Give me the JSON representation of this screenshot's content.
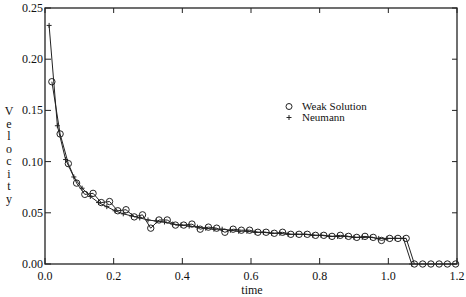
{
  "chart_data": {
    "type": "line",
    "title": "",
    "xlabel": "time",
    "ylabel": "Velocity",
    "xlim": [
      0.0,
      1.2
    ],
    "ylim": [
      0.0,
      0.25
    ],
    "xticks": [
      "0.0",
      "0.2",
      "0.4",
      "0.6",
      "0.8",
      "1.0",
      "1.2"
    ],
    "yticks": [
      "0.00",
      "0.05",
      "0.10",
      "0.15",
      "0.20",
      "0.25"
    ],
    "grid": false,
    "legend_position": "right-middle",
    "series": [
      {
        "name": "Weak Solution",
        "marker": "circle",
        "x": [
          0.02,
          0.044,
          0.068,
          0.092,
          0.116,
          0.14,
          0.164,
          0.188,
          0.212,
          0.236,
          0.26,
          0.284,
          0.308,
          0.332,
          0.356,
          0.38,
          0.404,
          0.428,
          0.452,
          0.476,
          0.5,
          0.524,
          0.548,
          0.572,
          0.596,
          0.62,
          0.644,
          0.668,
          0.692,
          0.716,
          0.74,
          0.764,
          0.788,
          0.812,
          0.836,
          0.86,
          0.884,
          0.908,
          0.932,
          0.956,
          0.98,
          1.004,
          1.028,
          1.052,
          1.076,
          1.1,
          1.124,
          1.148,
          1.172,
          1.196
        ],
        "y": [
          0.178,
          0.127,
          0.098,
          0.079,
          0.068,
          0.069,
          0.06,
          0.061,
          0.052,
          0.053,
          0.046,
          0.048,
          0.035,
          0.043,
          0.043,
          0.038,
          0.038,
          0.039,
          0.034,
          0.036,
          0.035,
          0.031,
          0.034,
          0.033,
          0.033,
          0.031,
          0.031,
          0.03,
          0.031,
          0.029,
          0.029,
          0.029,
          0.028,
          0.028,
          0.027,
          0.028,
          0.027,
          0.026,
          0.027,
          0.026,
          0.023,
          0.025,
          0.025,
          0.025,
          0.0,
          0.0,
          0.0,
          0.0,
          0.0,
          0.0
        ]
      },
      {
        "name": "Neumann",
        "marker": "plus",
        "x": [
          0.012,
          0.036,
          0.06,
          0.084,
          0.108,
          0.132,
          0.156,
          0.18,
          0.204,
          0.228,
          0.252,
          0.276,
          0.3,
          0.324,
          0.348,
          0.372,
          0.396,
          0.42,
          0.444,
          0.468,
          0.492,
          0.516,
          0.54,
          0.564,
          0.588,
          0.612,
          0.636,
          0.66,
          0.684,
          0.708,
          0.732,
          0.756,
          0.78,
          0.804,
          0.828,
          0.852,
          0.876,
          0.9,
          0.924,
          0.948,
          0.972,
          0.996,
          1.02,
          1.044,
          1.068
        ],
        "y": [
          0.233,
          0.135,
          0.102,
          0.085,
          0.074,
          0.066,
          0.06,
          0.056,
          0.052,
          0.049,
          0.047,
          0.045,
          0.043,
          0.042,
          0.041,
          0.039,
          0.038,
          0.037,
          0.036,
          0.035,
          0.034,
          0.034,
          0.033,
          0.032,
          0.032,
          0.031,
          0.031,
          0.03,
          0.03,
          0.029,
          0.029,
          0.029,
          0.028,
          0.028,
          0.027,
          0.027,
          0.027,
          0.026,
          0.026,
          0.026,
          0.025,
          0.025,
          0.025,
          0.025,
          0.0
        ]
      }
    ]
  },
  "legend": {
    "items": [
      {
        "label": "Weak Solution",
        "symbol": "o"
      },
      {
        "label": "Neumann",
        "symbol": "+"
      }
    ]
  },
  "axes": {
    "x_title": "time",
    "y_title_letters": [
      "V",
      "e",
      "l",
      "o",
      "c",
      "i",
      "t",
      "y"
    ]
  }
}
